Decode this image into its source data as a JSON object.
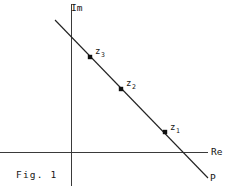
{
  "figure": {
    "caption": "Fig. 1",
    "background_color": "#ffffff",
    "stroke_color": "#2a2a2a",
    "text_color": "#141414",
    "width": 229,
    "height": 189
  },
  "axes": {
    "imaginary": {
      "label": "Im",
      "icon": "vertical-axis-icon",
      "x": 71,
      "y_top": 4,
      "y_bottom": 186
    },
    "real": {
      "label": "Re",
      "icon": "horizontal-axis-icon",
      "y": 152,
      "x_left": 0,
      "x_right": 208
    }
  },
  "line": {
    "name": "P",
    "label": "P",
    "x1": 55,
    "y1": 20,
    "x2": 208,
    "y2": 178
  },
  "points": [
    {
      "label": "z",
      "subscript": "3",
      "cx": 90,
      "cy": 57,
      "label_x": 95,
      "label_y": 47
    },
    {
      "label": "z",
      "subscript": "2",
      "cx": 121,
      "cy": 89,
      "label_x": 126,
      "label_y": 79
    },
    {
      "label": "z",
      "subscript": "1",
      "cx": 165,
      "cy": 132,
      "label_x": 170,
      "label_y": 123
    }
  ],
  "chart_data": {
    "type": "scatter",
    "title": "Fig. 1",
    "xlabel": "Re",
    "ylabel": "Im",
    "grid": false,
    "legend": null,
    "annotations": [
      "z_1",
      "z_2",
      "z_3",
      "P",
      "Im",
      "Re",
      "Fig. 1"
    ],
    "axis_origin_px": {
      "x": 71,
      "y": 152
    },
    "series": [
      {
        "name": "P",
        "kind": "line",
        "x": [
          55,
          208
        ],
        "y": [
          20,
          178
        ]
      },
      {
        "name": "marked points",
        "kind": "points",
        "labels": [
          "z_3",
          "z_2",
          "z_1"
        ],
        "x": [
          90,
          121,
          165
        ],
        "y": [
          57,
          89,
          132
        ]
      }
    ]
  }
}
